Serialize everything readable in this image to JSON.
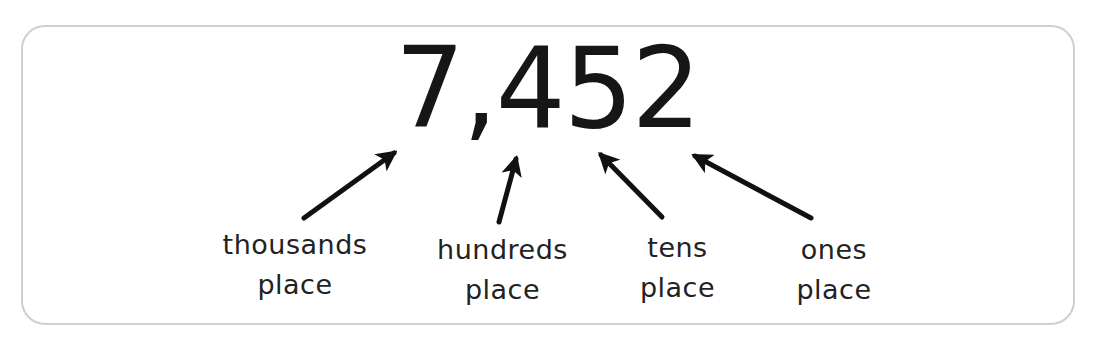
{
  "diagram": {
    "number": "7,452",
    "digits": [
      {
        "digit": "7",
        "place": "thousands"
      },
      {
        "digit": "4",
        "place": "hundreds"
      },
      {
        "digit": "5",
        "place": "tens"
      },
      {
        "digit": "2",
        "place": "ones"
      }
    ],
    "labels": [
      {
        "line1": "thousands",
        "line2": "place"
      },
      {
        "line1": "hundreds",
        "line2": "place"
      },
      {
        "line1": "tens",
        "line2": "place"
      },
      {
        "line1": "ones",
        "line2": "place"
      }
    ],
    "colors": {
      "text": "#161616",
      "arrow": "#111111",
      "border": "#cfcfcf",
      "background": "#ffffff"
    }
  }
}
